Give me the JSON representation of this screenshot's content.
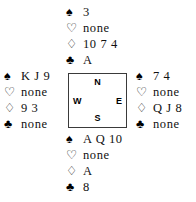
{
  "diagram": {
    "type": "bridge-hand-diagram",
    "suit_symbols": {
      "spades": "♠",
      "hearts": "♡",
      "diamonds": "♢",
      "clubs": "♣"
    },
    "compass": {
      "north": "N",
      "west": "W",
      "east": "E",
      "south": "S"
    },
    "hands": {
      "north": {
        "position_label": "North",
        "suits": [
          {
            "icon": "spade-icon",
            "symbol": "♠",
            "cards": "3"
          },
          {
            "icon": "heart-icon",
            "symbol": "♡",
            "cards": "none"
          },
          {
            "icon": "diamond-icon",
            "symbol": "♢",
            "cards": "10 7 4"
          },
          {
            "icon": "club-icon",
            "symbol": "♣",
            "cards": "A"
          }
        ]
      },
      "west": {
        "position_label": "West",
        "suits": [
          {
            "icon": "spade-icon",
            "symbol": "♠",
            "cards": "K J 9"
          },
          {
            "icon": "heart-icon",
            "symbol": "♡",
            "cards": "none"
          },
          {
            "icon": "diamond-icon",
            "symbol": "♢",
            "cards": "9 3"
          },
          {
            "icon": "club-icon",
            "symbol": "♣",
            "cards": "none"
          }
        ]
      },
      "east": {
        "position_label": "East",
        "suits": [
          {
            "icon": "spade-icon",
            "symbol": "♠",
            "cards": "7 4"
          },
          {
            "icon": "heart-icon",
            "symbol": "♡",
            "cards": "none"
          },
          {
            "icon": "diamond-icon",
            "symbol": "♢",
            "cards": "Q J 8"
          },
          {
            "icon": "club-icon",
            "symbol": "♣",
            "cards": "none"
          }
        ]
      },
      "south": {
        "position_label": "South",
        "suits": [
          {
            "icon": "spade-icon",
            "symbol": "♠",
            "cards": "A Q 10"
          },
          {
            "icon": "heart-icon",
            "symbol": "♡",
            "cards": "none"
          },
          {
            "icon": "diamond-icon",
            "symbol": "♢",
            "cards": "A"
          },
          {
            "icon": "club-icon",
            "symbol": "♣",
            "cards": "8"
          }
        ]
      }
    },
    "colors": {
      "text": "#111111",
      "background": "#ffffff",
      "box_border": "#3a3a3a"
    }
  }
}
